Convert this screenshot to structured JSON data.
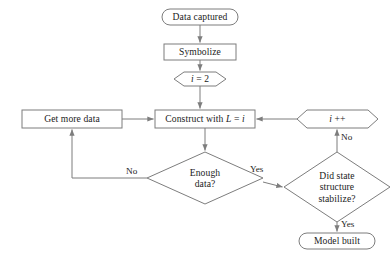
{
  "diagram": {
    "type": "flowchart",
    "colors": {
      "background": "#ffffff",
      "stroke": "#7d7d7d",
      "text": "#1b1b1b"
    },
    "nodes": [
      {
        "id": "data-captured",
        "shape": "terminator",
        "label": "Data captured"
      },
      {
        "id": "symbolize",
        "shape": "process",
        "label": "Symbolize"
      },
      {
        "id": "init-i",
        "shape": "preparation",
        "label": "i = 2",
        "label_plain": "i = 2",
        "italic_part": "i",
        "rest_part": " = 2"
      },
      {
        "id": "get-more-data",
        "shape": "process",
        "label": "Get more data"
      },
      {
        "id": "construct",
        "shape": "process",
        "label": "Construct with L = i",
        "prefix": "Construct with ",
        "italic_L": "L",
        "mid": " = ",
        "italic_i": "i"
      },
      {
        "id": "increment-i",
        "shape": "preparation",
        "label": "i ++",
        "italic_part": "i",
        "rest_part": " ++"
      },
      {
        "id": "enough-data",
        "shape": "decision",
        "label": "Enough data?",
        "line1": "Enough",
        "line2": "data?"
      },
      {
        "id": "state-stabilize",
        "shape": "decision",
        "label": "Did state structure stabilize?",
        "line1": "Did state",
        "line2": "structure",
        "line3": "stabilize?"
      },
      {
        "id": "model-built",
        "shape": "terminator",
        "label": "Model built"
      }
    ],
    "edge_labels": [
      {
        "id": "enough-data-no",
        "label": "No",
        "from": "enough-data",
        "to": "get-more-data"
      },
      {
        "id": "enough-data-yes",
        "label": "Yes",
        "from": "enough-data",
        "to": "state-stabilize"
      },
      {
        "id": "stabilize-no",
        "label": "No",
        "from": "state-stabilize",
        "to": "increment-i"
      },
      {
        "id": "stabilize-yes",
        "label": "Yes",
        "from": "state-stabilize",
        "to": "model-built"
      }
    ]
  }
}
